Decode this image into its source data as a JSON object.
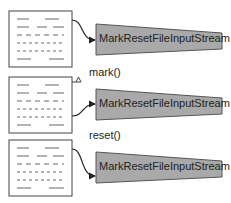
{
  "diagram": {
    "stream_class_label": "MarkResetFileInputStream",
    "colors": {
      "stream_fill": "#a9a9a9",
      "stream_stroke": "#555555",
      "file_stroke": "#444444",
      "line_color": "#222222",
      "background": "#ffffff"
    },
    "stages": [
      {
        "id": "initial",
        "method_label": "",
        "text": "MarkResetFileInputStream",
        "arrow_from": "top-right"
      },
      {
        "id": "after-mark",
        "method_label": "mark()",
        "text": "MarkResetFileInputStream",
        "arrow_from": "lower-right",
        "mark_indicator": "triangle"
      },
      {
        "id": "after-reset",
        "method_label": "reset()",
        "text": "MarkResetFileInputStream",
        "arrow_from": "top-right"
      }
    ]
  }
}
